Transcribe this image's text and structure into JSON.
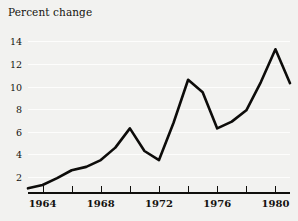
{
  "chart_data": {
    "type": "line",
    "title": "Percent change",
    "xlabel": "",
    "ylabel": "Percent change",
    "grid": true,
    "legend": false,
    "xlim": [
      1963,
      1981
    ],
    "ylim": [
      0.5,
      15
    ],
    "x": [
      1963,
      1964,
      1965,
      1966,
      1967,
      1968,
      1969,
      1970,
      1971,
      1972,
      1973,
      1974,
      1975,
      1976,
      1977,
      1978,
      1979,
      1980,
      1981
    ],
    "values": [
      1.0,
      1.3,
      1.9,
      2.6,
      2.9,
      3.5,
      4.6,
      6.3,
      4.3,
      3.5,
      6.8,
      10.6,
      9.5,
      6.3,
      6.9,
      7.9,
      10.4,
      13.3,
      10.3
    ],
    "series": [
      {
        "name": "Percent change",
        "color": "#0d0c0a",
        "values": [
          1.0,
          1.3,
          1.9,
          2.6,
          2.9,
          3.5,
          4.6,
          6.3,
          4.3,
          3.5,
          6.8,
          10.6,
          9.5,
          6.3,
          6.9,
          7.9,
          10.4,
          13.3,
          10.3
        ]
      }
    ],
    "y_ticks": [
      2,
      4,
      6,
      8,
      10,
      12,
      14
    ],
    "y_tick_labels": [
      "2",
      "4",
      "6",
      "8",
      "10",
      "12",
      "14"
    ],
    "x_ticks": [
      1964,
      1966,
      1968,
      1970,
      1972,
      1974,
      1976,
      1978,
      1980
    ],
    "x_tick_labels": [
      "1964",
      "",
      "1968",
      "",
      "1972",
      "",
      "1976",
      "",
      "1980"
    ],
    "x_labeled_ticks": [
      {
        "year": 1964,
        "label": "1964"
      },
      {
        "year": 1968,
        "label": "1968"
      },
      {
        "year": 1972,
        "label": "1972"
      },
      {
        "year": 1976,
        "label": "1976"
      },
      {
        "year": 1980,
        "label": "1980"
      }
    ],
    "colors": {
      "figure_background": "#f2f2f0",
      "plot_background": "#f2f2f0",
      "gridline": "#fdfdfc",
      "axis": "#100f0c",
      "line": "#0d0c0a",
      "text": "#14120f"
    }
  }
}
